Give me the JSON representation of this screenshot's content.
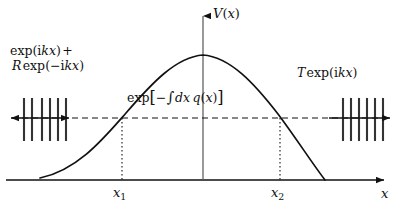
{
  "figure": {
    "background_color": "#ffffff",
    "ink_color": "#111111",
    "width": 401,
    "height": 212
  },
  "axes": {
    "vertical": {
      "name": "potential-axis",
      "label_prefix": "V",
      "label_open": "(",
      "label_var": "x",
      "label_close": ")",
      "label_full": "V(x)",
      "x": 203,
      "top": 14,
      "bottom": 180,
      "arrow": "up"
    },
    "horizontal": {
      "name": "position-axis",
      "label": "x",
      "y": 180,
      "left": 6,
      "right": 386,
      "arrow": "right"
    }
  },
  "ticks": [
    {
      "name": "turning-point-1",
      "base_label": "x",
      "sub_label": "1",
      "label_full": "x1",
      "x": 122,
      "drop_from_y": 118,
      "drop_to_y": 180
    },
    {
      "name": "turning-point-2",
      "base_label": "x",
      "sub_label": "2",
      "label_full": "x2",
      "x": 280,
      "drop_from_y": 118,
      "drop_to_y": 180
    }
  ],
  "energy_level": {
    "name": "energy-dashed-line",
    "y": 118,
    "left": 8,
    "right": 392,
    "style": "dashed"
  },
  "barrier_curve": {
    "name": "potential-barrier-curve",
    "peak_x": 203,
    "peak_y": 55,
    "left_foot_x": 40,
    "left_foot_y": 178,
    "right_foot_x": 325,
    "right_foot_y": 180,
    "path": "M 40 178 C 78 170, 104 138, 126 113 C 152 83, 176 57, 203 55 C 230 57, 254 83, 278 114 C 296 138, 312 163, 325 180"
  },
  "labels": {
    "incident": {
      "name": "incident-wave-label",
      "line1_fn": "exp",
      "line1_arg_open": "(",
      "line1_i": "i",
      "line1_k": "k",
      "line1_x": "x",
      "line1_arg_close": ")",
      "line1_plus": "+",
      "line2_R": "R",
      "line2_fn": "exp",
      "line2_arg_open": "(",
      "line2_minus": "−",
      "line2_i": "i",
      "line2_k": "k",
      "line2_x": "x",
      "line2_arg_close": ")",
      "text_full": "exp(ikx) + R exp(−ikx)"
    },
    "transmitted": {
      "name": "transmitted-wave-label",
      "T": "T",
      "fn": "exp",
      "arg_open": "(",
      "i": "i",
      "k": "k",
      "x": "x",
      "arg_close": ")",
      "text_full": "T exp(ikx)"
    },
    "tunnel": {
      "name": "tunnelling-amplitude-label",
      "fn": "exp",
      "bracket_open": "[",
      "minus": "−",
      "integral": "∫",
      "d": "d",
      "x": "x",
      "q": "q",
      "q_open": "(",
      "q_var": "x",
      "q_close": ")",
      "bracket_close": "]",
      "text_full": "exp[−∫dx q(x)]"
    }
  },
  "wave_packets": [
    {
      "name": "incident-reflected-wave-marks",
      "side": "left",
      "arrow_style": "double",
      "arrow_left_x": 8,
      "arrow_right_x": 72,
      "y": 118,
      "tick_count": 6,
      "tick_x_positions": [
        24,
        32,
        42,
        50,
        58,
        66
      ],
      "tick_top_y": 98,
      "tick_bottom_y": 141
    },
    {
      "name": "transmitted-wave-marks",
      "side": "right",
      "arrow_style": "single-right",
      "arrow_left_x": 327,
      "arrow_right_x": 392,
      "y": 118,
      "tick_count": 6,
      "tick_x_positions": [
        343,
        351,
        359,
        367,
        375,
        383
      ],
      "tick_top_y": 98,
      "tick_bottom_y": 141
    }
  ]
}
